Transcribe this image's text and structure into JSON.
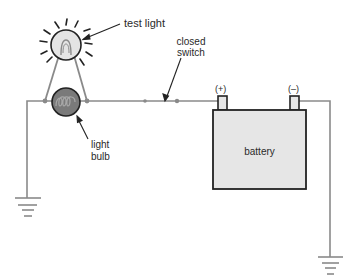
{
  "diagram": {
    "type": "circuit",
    "labels": {
      "test_light": "test light",
      "closed_switch_line1": "closed",
      "closed_switch_line2": "switch",
      "positive_terminal": "(+)",
      "negative_terminal": "(–)",
      "light_bulb_line1": "light",
      "light_bulb_line2": "bulb",
      "battery": "battery"
    },
    "components": [
      {
        "id": "test-light",
        "kind": "lamp",
        "state": "lit"
      },
      {
        "id": "light-bulb",
        "kind": "lamp",
        "state": "off"
      },
      {
        "id": "closed-switch",
        "kind": "switch",
        "state": "closed"
      },
      {
        "id": "battery",
        "kind": "battery",
        "terminals": [
          "(+)",
          "(–)"
        ]
      },
      {
        "id": "ground-left",
        "kind": "ground"
      },
      {
        "id": "ground-right",
        "kind": "ground"
      }
    ],
    "colors": {
      "wire": "#8a8a8a",
      "outline": "#222222",
      "test_light_fill": "#e4e4e4",
      "light_bulb_fill": "#7a7a7a",
      "battery_fill": "#e6e6e6",
      "text": "#2a2a2a"
    }
  }
}
